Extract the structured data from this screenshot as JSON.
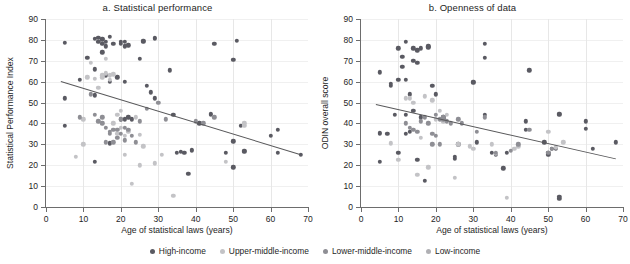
{
  "figure": {
    "xlabel": "Age of statistical laws (years)",
    "legend": [
      {
        "label": "High-income",
        "color": "#5a5a62"
      },
      {
        "label": "Upper-middle-income",
        "color": "#c3c3c6"
      },
      {
        "label": "Lower-middle-income",
        "color": "#8e8e94"
      },
      {
        "label": "Low-income",
        "color": "#b0b0b4"
      }
    ]
  },
  "chart_data": [
    {
      "type": "scatter",
      "title": "a. Statistical performance",
      "xlabel": "Age of statistical laws (years)",
      "ylabel": "Statistical Performance Index",
      "xlim": [
        0,
        70
      ],
      "ylim": [
        0,
        90
      ],
      "xticks": [
        0,
        10,
        20,
        30,
        40,
        50,
        60,
        70
      ],
      "yticks": [
        0,
        10,
        20,
        30,
        40,
        50,
        60,
        70,
        80,
        90
      ],
      "grid": true,
      "legend_position": "bottom",
      "trendline": {
        "x0": 4,
        "y0": 60.5,
        "x1": 68,
        "y1": 25.5
      },
      "series": [
        {
          "name": "High-income",
          "color": "#5a5a62",
          "points": [
            [
              5,
              78.5
            ],
            [
              5,
              52
            ],
            [
              5,
              39
            ],
            [
              9,
              61
            ],
            [
              11,
              71.5
            ],
            [
              13,
              66
            ],
            [
              13,
              80.5
            ],
            [
              13,
              53.5
            ],
            [
              13,
              21.5
            ],
            [
              14,
              79
            ],
            [
              14,
              81
            ],
            [
              15,
              78
            ],
            [
              15,
              80
            ],
            [
              15,
              80.5
            ],
            [
              15,
              74
            ],
            [
              16,
              79
            ],
            [
              16,
              63
            ],
            [
              16,
              77
            ],
            [
              17,
              81.5
            ],
            [
              17,
              60
            ],
            [
              17,
              30.5
            ],
            [
              18,
              78
            ],
            [
              19,
              62
            ],
            [
              20,
              79
            ],
            [
              20,
              78
            ],
            [
              20,
              42
            ],
            [
              21,
              77
            ],
            [
              21,
              79
            ],
            [
              21,
              60
            ],
            [
              21,
              42
            ],
            [
              22,
              77.5
            ],
            [
              22,
              43
            ],
            [
              23,
              42
            ],
            [
              25,
              71
            ],
            [
              26,
              79
            ],
            [
              26,
              79.5
            ],
            [
              27,
              58
            ],
            [
              28,
              55
            ],
            [
              29,
              80.5
            ],
            [
              29,
              81
            ],
            [
              29,
              52
            ],
            [
              33,
              65.5
            ],
            [
              34,
              44
            ],
            [
              35,
              26
            ],
            [
              36,
              26.5
            ],
            [
              37,
              26
            ],
            [
              38,
              16
            ],
            [
              39,
              27
            ],
            [
              39,
              27.5
            ],
            [
              41,
              40
            ],
            [
              44,
              44
            ],
            [
              44,
              44.5
            ],
            [
              45,
              78
            ],
            [
              48,
              26
            ],
            [
              50,
              70.5
            ],
            [
              50,
              31.5
            ],
            [
              50,
              19
            ],
            [
              51,
              79.5
            ],
            [
              52,
              39
            ],
            [
              53,
              27
            ],
            [
              53,
              26.5
            ],
            [
              60,
              34
            ],
            [
              62,
              26
            ],
            [
              62,
              37
            ],
            [
              68,
              25
            ]
          ]
        },
        {
          "name": "Upper-middle-income",
          "color": "#c3c3c6",
          "points": [
            [
              8,
              24
            ],
            [
              10,
              42
            ],
            [
              10,
              30
            ],
            [
              11,
              62
            ],
            [
              12,
              69
            ],
            [
              13,
              61.5
            ],
            [
              14,
              57
            ],
            [
              15,
              63
            ],
            [
              15,
              62
            ],
            [
              16,
              71
            ],
            [
              16,
              64
            ],
            [
              17,
              63
            ],
            [
              17,
              61
            ],
            [
              18,
              63.5
            ],
            [
              18,
              40
            ],
            [
              19,
              35
            ],
            [
              19,
              44
            ],
            [
              20,
              46
            ],
            [
              20,
              38
            ],
            [
              21,
              25
            ],
            [
              21,
              34
            ],
            [
              22,
              36
            ],
            [
              23,
              11
            ],
            [
              24,
              43
            ],
            [
              25,
              34.5
            ],
            [
              25,
              20
            ],
            [
              26,
              29
            ],
            [
              29,
              21
            ],
            [
              31,
              25
            ],
            [
              34,
              5.5
            ],
            [
              48,
              21.5
            ],
            [
              53,
              39
            ],
            [
              53,
              40
            ]
          ]
        },
        {
          "name": "Lower-middle-income",
          "color": "#8e8e94",
          "points": [
            [
              9,
              43
            ],
            [
              12,
              54
            ],
            [
              13,
              44
            ],
            [
              14,
              41
            ],
            [
              15,
              40
            ],
            [
              15,
              43
            ],
            [
              16,
              38
            ],
            [
              16,
              31
            ],
            [
              17,
              36
            ],
            [
              17,
              35
            ],
            [
              18,
              37
            ],
            [
              18,
              31
            ],
            [
              19,
              33
            ],
            [
              19,
              37
            ],
            [
              20,
              42
            ],
            [
              20,
              35
            ],
            [
              21,
              38
            ],
            [
              21,
              32
            ],
            [
              22,
              37
            ],
            [
              23,
              34
            ],
            [
              24,
              31
            ],
            [
              25,
              41
            ],
            [
              27,
              47
            ],
            [
              30,
              50
            ],
            [
              32,
              42
            ],
            [
              40,
              41
            ],
            [
              42,
              40
            ],
            [
              45,
              43
            ]
          ]
        },
        {
          "name": "Low-income",
          "color": "#b0b0b4"
        }
      ]
    },
    {
      "type": "scatter",
      "title": "b. Openness of data",
      "xlabel": "Age of statistical laws (years)",
      "ylabel": "ODIN overall score",
      "xlim": [
        0,
        70
      ],
      "ylim": [
        0,
        90
      ],
      "xticks": [
        0,
        10,
        20,
        30,
        40,
        50,
        60,
        70
      ],
      "yticks": [
        0,
        10,
        20,
        30,
        40,
        50,
        60,
        70,
        80,
        90
      ],
      "grid": true,
      "legend_position": "bottom",
      "trendline": {
        "x0": 4,
        "y0": 49.5,
        "x1": 68,
        "y1": 23.5
      },
      "series": [
        {
          "name": "High-income",
          "color": "#5a5a62",
          "points": [
            [
              5,
              64.5
            ],
            [
              5,
              35
            ],
            [
              5,
              35.5
            ],
            [
              5,
              21.5
            ],
            [
              7,
              35
            ],
            [
              8,
              58
            ],
            [
              8,
              59
            ],
            [
              9,
              44
            ],
            [
              10,
              76
            ],
            [
              10,
              61
            ],
            [
              10,
              26
            ],
            [
              11,
              72
            ],
            [
              11,
              67
            ],
            [
              12,
              79
            ],
            [
              12,
              61
            ],
            [
              12,
              44
            ],
            [
              12,
              35
            ],
            [
              13,
              54
            ],
            [
              13,
              36
            ],
            [
              14,
              76
            ],
            [
              14,
              70
            ],
            [
              14,
              46
            ],
            [
              15,
              75
            ],
            [
              15,
              69
            ],
            [
              15,
              22.5
            ],
            [
              16,
              76
            ],
            [
              16,
              43
            ],
            [
              17,
              12.5
            ],
            [
              18,
              77
            ],
            [
              18,
              76.5
            ],
            [
              19,
              58
            ],
            [
              20,
              54
            ],
            [
              22,
              42
            ],
            [
              22,
              43
            ],
            [
              25,
              24
            ],
            [
              25,
              23
            ],
            [
              26,
              30
            ],
            [
              30,
              60
            ],
            [
              30,
              59.5
            ],
            [
              31,
              31
            ],
            [
              33,
              78
            ],
            [
              33,
              71.5
            ],
            [
              33,
              44
            ],
            [
              35,
              26
            ],
            [
              36,
              25
            ],
            [
              38,
              18.5
            ],
            [
              39,
              26
            ],
            [
              44,
              41
            ],
            [
              44,
              37
            ],
            [
              45,
              65.5
            ],
            [
              49,
              31
            ],
            [
              50,
              25
            ],
            [
              50,
              26
            ],
            [
              51,
              28
            ],
            [
              52,
              28
            ],
            [
              53,
              44
            ],
            [
              53,
              44.5
            ],
            [
              53,
              4
            ],
            [
              53,
              5
            ],
            [
              60,
              41
            ],
            [
              60,
              37.5
            ],
            [
              62,
              28
            ],
            [
              68,
              31
            ]
          ]
        },
        {
          "name": "Upper-middle-income",
          "color": "#c3c3c6",
          "points": [
            [
              8,
              30.5
            ],
            [
              10,
              22.5
            ],
            [
              12,
              52
            ],
            [
              13,
              52
            ],
            [
              14,
              50
            ],
            [
              15,
              15.5
            ],
            [
              16,
              33
            ],
            [
              17,
              53
            ],
            [
              18,
              19
            ],
            [
              19,
              51
            ],
            [
              20,
              42
            ],
            [
              21,
              46
            ],
            [
              22,
              41
            ],
            [
              23,
              44
            ],
            [
              25,
              14
            ],
            [
              26,
              30
            ],
            [
              29,
              29
            ],
            [
              30,
              28
            ],
            [
              35,
              30
            ],
            [
              36,
              25.5
            ],
            [
              39,
              4.5
            ],
            [
              41,
              28
            ],
            [
              42,
              29
            ],
            [
              50,
              36
            ],
            [
              52,
              28.5
            ],
            [
              54,
              31
            ]
          ]
        },
        {
          "name": "Lower-middle-income",
          "color": "#8e8e94",
          "points": [
            [
              12,
              40
            ],
            [
              13,
              38
            ],
            [
              14,
              37
            ],
            [
              15,
              36
            ],
            [
              16,
              41
            ],
            [
              17,
              43
            ],
            [
              18,
              40
            ],
            [
              19,
              35
            ],
            [
              19,
              30
            ],
            [
              20,
              44
            ],
            [
              20,
              34
            ],
            [
              21,
              42
            ],
            [
              21,
              30
            ],
            [
              22,
              43
            ],
            [
              22,
              42
            ],
            [
              23,
              41
            ],
            [
              24,
              40
            ],
            [
              26,
              42
            ],
            [
              27,
              40
            ],
            [
              31,
              36
            ],
            [
              33,
              43
            ],
            [
              36,
              26
            ],
            [
              40,
              27
            ],
            [
              42,
              30
            ],
            [
              45,
              37
            ],
            [
              50,
              26
            ],
            [
              51,
              28
            ]
          ]
        },
        {
          "name": "Low-income",
          "color": "#b0b0b4"
        }
      ]
    }
  ]
}
